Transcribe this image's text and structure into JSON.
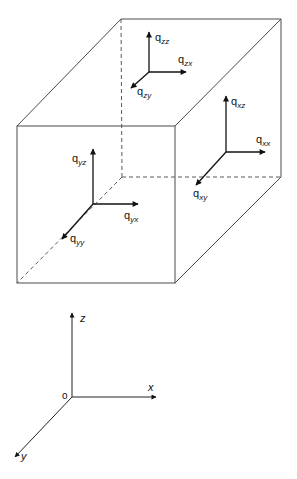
{
  "diagram": {
    "cube": {
      "front_face": {
        "top_left": [
          17,
          126
        ],
        "top_right": [
          175,
          126
        ],
        "bottom_right": [
          175,
          283
        ],
        "bottom_left": [
          17,
          283
        ]
      },
      "back_face": {
        "top_left": [
          121,
          19
        ],
        "top_right": [
          281,
          19
        ],
        "bottom_right": [
          281,
          177
        ],
        "bottom_left": [
          122,
          177
        ]
      }
    },
    "vector_groups": [
      {
        "name": "top-face",
        "origin": [
          149,
          72
        ],
        "vectors": [
          {
            "symbol": "q",
            "subscript": "zz",
            "tip": [
              149,
              32
            ],
            "label_pos": [
              157,
              40
            ]
          },
          {
            "symbol": "q",
            "subscript": "zx",
            "tip": [
              186,
              72
            ],
            "label_pos": [
              178,
              63
            ]
          },
          {
            "symbol": "q",
            "subscript": "zy",
            "tip": [
              131,
              88
            ],
            "label_pos": [
              138,
              96
            ]
          }
        ]
      },
      {
        "name": "right-face",
        "origin": [
          226,
          152
        ],
        "vectors": [
          {
            "symbol": "q",
            "subscript": "xz",
            "tip": [
              226,
              96
            ],
            "label_pos": [
              232,
              105
            ]
          },
          {
            "symbol": "q",
            "subscript": "xx",
            "tip": [
              265,
              152
            ],
            "label_pos": [
              256,
              141
            ]
          },
          {
            "symbol": "q",
            "subscript": "xy",
            "tip": [
              196,
              185
            ],
            "label_pos": [
              193,
              199
            ]
          }
        ]
      },
      {
        "name": "front-face",
        "origin": [
          93,
          204
        ],
        "vectors": [
          {
            "symbol": "q",
            "subscript": "yz",
            "tip": [
              93,
              149
            ],
            "label_pos": [
              73,
              164
            ]
          },
          {
            "symbol": "q",
            "subscript": "yx",
            "tip": [
              138,
              204
            ],
            "label_pos": [
              124,
              220
            ]
          },
          {
            "symbol": "q",
            "subscript": "yy",
            "tip": [
              62,
              239
            ],
            "label_pos": [
              70,
              243
            ]
          }
        ]
      }
    ],
    "axes": {
      "origin": [
        72,
        397
      ],
      "origin_label": "o",
      "x": {
        "label": "x",
        "tip": [
          156,
          397
        ]
      },
      "y": {
        "label": "y",
        "tip": [
          15,
          457
        ]
      },
      "z": {
        "label": "z",
        "tip": [
          72,
          313
        ]
      }
    }
  }
}
